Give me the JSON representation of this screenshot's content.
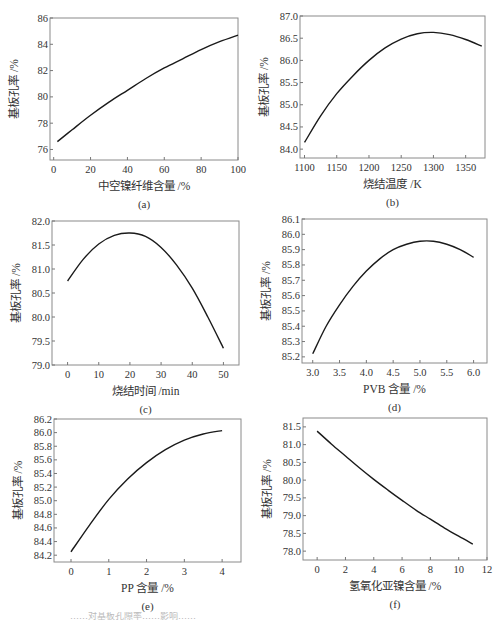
{
  "figure": {
    "bottom_caption_partial": "……对基板孔隙率……影响……"
  },
  "chart_data": [
    {
      "id": "a",
      "type": "line",
      "label": "(a)",
      "title": "",
      "xlabel": "中空镍纤维含量 /%",
      "ylabel": "基板孔率 /%",
      "xlim": [
        -2,
        100
      ],
      "ylim": [
        75.2,
        86
      ],
      "xticks": [
        0,
        20,
        40,
        60,
        80,
        100
      ],
      "yticks": [
        76,
        78,
        80,
        82,
        84,
        86
      ],
      "ytick_decimals": 0,
      "grid": false,
      "x": [
        2,
        10,
        20,
        30,
        40,
        50,
        60,
        70,
        80,
        90,
        100
      ],
      "y": [
        76.6,
        77.5,
        78.6,
        79.6,
        80.5,
        81.4,
        82.2,
        82.9,
        83.6,
        84.2,
        84.7
      ],
      "box": [
        50,
        18,
        238,
        160
      ]
    },
    {
      "id": "b",
      "type": "line",
      "label": "(b)",
      "title": "",
      "xlabel": "烧结温度 /K",
      "ylabel": "基板孔率 /%",
      "xlim": [
        1093,
        1380
      ],
      "ylim": [
        83.8,
        87.0
      ],
      "xticks": [
        1100,
        1150,
        1200,
        1250,
        1300,
        1350
      ],
      "yticks": [
        84.0,
        84.5,
        85.0,
        85.5,
        86.0,
        86.5,
        87.0
      ],
      "ytick_decimals": 1,
      "grid": false,
      "x": [
        1100,
        1125,
        1150,
        1175,
        1200,
        1225,
        1250,
        1275,
        1300,
        1325,
        1350,
        1375
      ],
      "y": [
        84.15,
        84.75,
        85.25,
        85.65,
        86.0,
        86.28,
        86.48,
        86.6,
        86.63,
        86.58,
        86.47,
        86.32
      ],
      "box": [
        300,
        16,
        485,
        158
      ]
    },
    {
      "id": "c",
      "type": "line",
      "label": "(c)",
      "title": "",
      "xlabel": "烧结时间 /min",
      "ylabel": "基板孔率 /%",
      "xlim": [
        -5,
        55
      ],
      "ylim": [
        79.0,
        82.0
      ],
      "xticks": [
        0,
        10,
        20,
        30,
        40,
        50
      ],
      "yticks": [
        79.0,
        79.5,
        80.0,
        80.5,
        81.0,
        81.5,
        82.0
      ],
      "ytick_decimals": 1,
      "grid": false,
      "x": [
        0,
        5,
        10,
        15,
        20,
        25,
        30,
        35,
        40,
        45,
        50
      ],
      "y": [
        80.75,
        81.2,
        81.52,
        81.7,
        81.75,
        81.68,
        81.45,
        81.08,
        80.6,
        80.0,
        79.35
      ],
      "box": [
        52,
        221,
        239,
        365
      ]
    },
    {
      "id": "d",
      "type": "line",
      "label": "(d)",
      "title": "",
      "xlabel": "PVB 含量 /%",
      "ylabel": "基板孔率 /%",
      "xlim": [
        2.8,
        6.25
      ],
      "ylim": [
        85.16,
        86.1
      ],
      "xticks": [
        3.0,
        3.5,
        4.0,
        4.5,
        5.0,
        5.5,
        6.0
      ],
      "yticks": [
        85.2,
        85.3,
        85.4,
        85.5,
        85.6,
        85.7,
        85.8,
        85.9,
        86.0,
        86.1
      ],
      "ytick_decimals": 1,
      "xtick_decimals": 1,
      "grid": false,
      "x": [
        3.0,
        3.25,
        3.5,
        3.75,
        4.0,
        4.25,
        4.5,
        4.75,
        5.0,
        5.25,
        5.5,
        5.75,
        6.0
      ],
      "y": [
        85.22,
        85.4,
        85.54,
        85.66,
        85.76,
        85.84,
        85.9,
        85.935,
        85.955,
        85.955,
        85.935,
        85.9,
        85.85
      ],
      "box": [
        302,
        219,
        487,
        363
      ]
    },
    {
      "id": "e",
      "type": "line",
      "label": "(e)",
      "title": "",
      "xlabel": "PP 含量 /%",
      "ylabel": "基板孔率 /%",
      "xlim": [
        -0.45,
        4.5
      ],
      "ylim": [
        84.1,
        86.2
      ],
      "xticks": [
        0,
        1,
        2,
        3,
        4
      ],
      "yticks": [
        84.2,
        84.4,
        84.6,
        84.8,
        85.0,
        85.2,
        85.4,
        85.6,
        85.8,
        86.0,
        86.2
      ],
      "ytick_decimals": 1,
      "grid": false,
      "x": [
        0,
        0.5,
        1.0,
        1.5,
        2.0,
        2.5,
        3.0,
        3.5,
        4.0
      ],
      "y": [
        84.25,
        84.65,
        85.02,
        85.32,
        85.56,
        85.75,
        85.89,
        85.98,
        86.03
      ],
      "box": [
        54,
        419,
        241,
        562
      ]
    },
    {
      "id": "f",
      "type": "line",
      "label": "(f)",
      "title": "",
      "xlabel": "氢氧化亚镍含量 /%",
      "ylabel": "基板孔率 /%",
      "xlim": [
        -1,
        12
      ],
      "ylim": [
        77.75,
        81.75
      ],
      "xticks": [
        0,
        2,
        4,
        6,
        8,
        10,
        12
      ],
      "yticks": [
        78.0,
        78.5,
        79.0,
        79.5,
        80.0,
        80.5,
        81.0,
        81.5
      ],
      "ytick_decimals": 1,
      "grid": false,
      "x": [
        0,
        1,
        2,
        3,
        4,
        5,
        6,
        7,
        8,
        9,
        10,
        11
      ],
      "y": [
        81.38,
        81.02,
        80.68,
        80.34,
        80.02,
        79.72,
        79.43,
        79.15,
        78.9,
        78.65,
        78.42,
        78.2
      ],
      "box": [
        303,
        418,
        487,
        560
      ]
    }
  ]
}
